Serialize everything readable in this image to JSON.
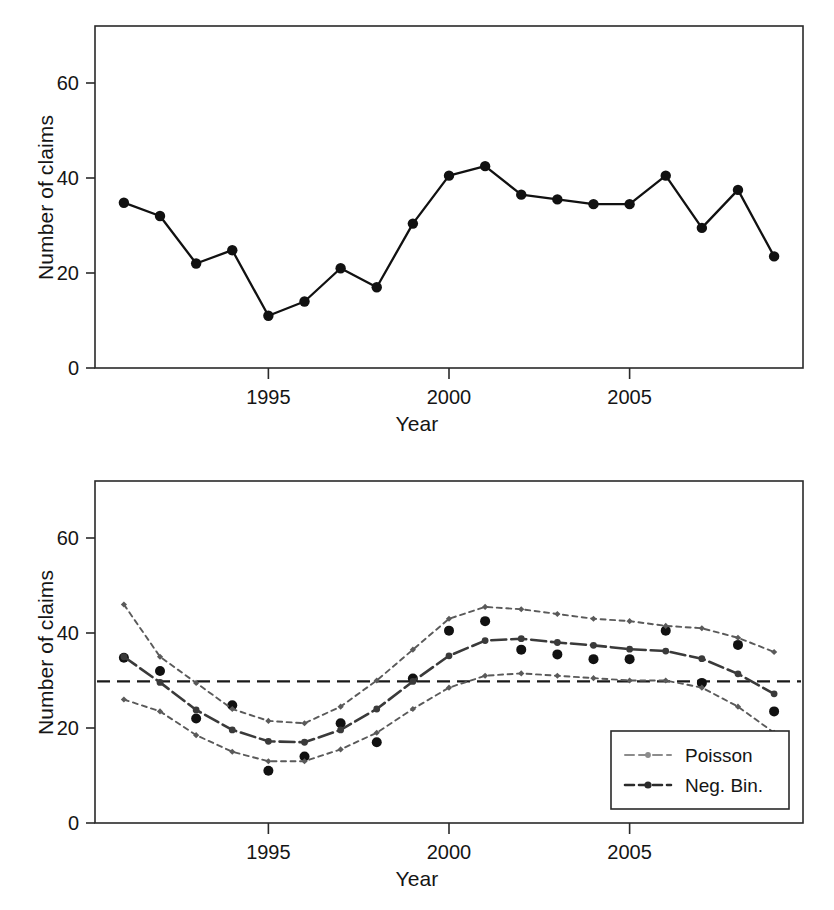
{
  "figure": {
    "background": "#ffffff",
    "panels": [
      "observed-series-panel",
      "fitted-model-panel"
    ]
  },
  "axis": {
    "ylabel": "Number of claims",
    "xlabel": "Year",
    "yticks": [
      "0",
      "20",
      "40",
      "60"
    ],
    "xticks": [
      "1995",
      "2000",
      "2005"
    ],
    "ytick_values": [
      0,
      20,
      40,
      60
    ],
    "xtick_values": [
      1995,
      2000,
      2005
    ]
  },
  "legend": {
    "position": "bottom-right",
    "items": [
      {
        "label": "Poisson",
        "color": "#8c8c8c"
      },
      {
        "label": "Neg. Bin.",
        "color": "#2b2b2b"
      }
    ]
  },
  "colors": {
    "observed": "#111111",
    "poisson": "#8c8c8c",
    "negbin": "#3a3a3a",
    "band": "#5a5a5a",
    "reference": "#1a1a1a",
    "axis": "#2a2a2a"
  },
  "chart_data": [
    {
      "id": "observed-series-panel",
      "type": "line",
      "title": "",
      "xlabel": "Year",
      "ylabel": "Number of claims",
      "xlim": [
        1990.2,
        2009.8
      ],
      "ylim": [
        0,
        72
      ],
      "ytick_values": [
        0,
        20,
        40,
        60
      ],
      "xtick_values": [
        1995,
        2000,
        2005
      ],
      "grid": false,
      "legend": "none",
      "markers": true,
      "x": [
        1991,
        1992,
        1993,
        1994,
        1995,
        1996,
        1997,
        1998,
        1999,
        2000,
        2001,
        2002,
        2003,
        2004,
        2005,
        2006,
        2007,
        2008,
        2009
      ],
      "series": [
        {
          "name": "Number of claims",
          "values": [
            34.8,
            32.0,
            22.0,
            24.8,
            11.0,
            14.0,
            21.0,
            17.0,
            30.4,
            40.5,
            42.5,
            36.5,
            35.5,
            34.5,
            34.5,
            40.5,
            29.5,
            37.5,
            23.5
          ]
        }
      ]
    },
    {
      "id": "fitted-model-panel",
      "type": "line",
      "title": "",
      "xlabel": "Year",
      "ylabel": "Number of claims",
      "xlim": [
        1990.2,
        2009.8
      ],
      "ylim": [
        0,
        72
      ],
      "ytick_values": [
        0,
        20,
        40,
        60
      ],
      "xtick_values": [
        1995,
        2000,
        2005
      ],
      "grid": false,
      "legend": "bottom-right",
      "reference_line": {
        "y": 29.8,
        "style": "dashed",
        "label": "overall mean"
      },
      "x": [
        1991,
        1992,
        1993,
        1994,
        1995,
        1996,
        1997,
        1998,
        1999,
        2000,
        2001,
        2002,
        2003,
        2004,
        2005,
        2006,
        2007,
        2008,
        2009
      ],
      "series": [
        {
          "name": "Observed",
          "style": "points",
          "values": [
            34.8,
            32.0,
            22.0,
            24.8,
            11.0,
            14.0,
            21.0,
            17.0,
            30.4,
            40.5,
            42.5,
            36.5,
            35.5,
            34.5,
            34.5,
            40.5,
            29.5,
            37.5,
            23.5
          ]
        },
        {
          "name": "Neg. Bin.",
          "style": "fitted-mean",
          "values": [
            35.0,
            29.6,
            23.8,
            19.6,
            17.2,
            17.0,
            19.6,
            24.0,
            29.8,
            35.2,
            38.4,
            38.8,
            38.0,
            37.4,
            36.6,
            36.2,
            34.6,
            31.4,
            27.2
          ]
        },
        {
          "name": "Upper band",
          "style": "dotted",
          "values": [
            46.0,
            35.0,
            29.5,
            24.0,
            21.5,
            21.0,
            24.5,
            30.0,
            36.5,
            43.0,
            45.5,
            45.0,
            44.0,
            43.0,
            42.5,
            41.5,
            41.0,
            39.0,
            36.0
          ]
        },
        {
          "name": "Lower band",
          "style": "dotted",
          "values": [
            26.0,
            23.5,
            18.5,
            15.0,
            13.0,
            13.0,
            15.5,
            19.0,
            24.0,
            28.5,
            31.0,
            31.5,
            31.0,
            30.5,
            30.0,
            30.0,
            28.5,
            24.5,
            19.0
          ]
        }
      ]
    }
  ]
}
